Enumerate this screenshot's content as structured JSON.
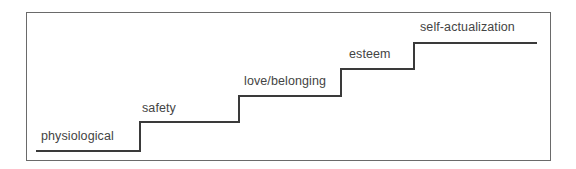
{
  "diagram": {
    "type": "staircase",
    "steps": [
      {
        "label": "physiological",
        "order": 1
      },
      {
        "label": "safety",
        "order": 2
      },
      {
        "label": "love/belonging",
        "order": 3
      },
      {
        "label": "esteem",
        "order": 4
      },
      {
        "label": "self-actualization",
        "order": 5
      }
    ]
  },
  "colors": {
    "frame": "#6a6a6a",
    "stairs": "#3a3a3a",
    "text": "#444444",
    "background": "#ffffff"
  }
}
